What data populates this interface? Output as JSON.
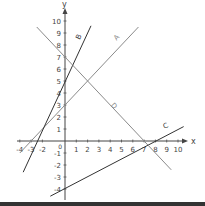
{
  "chart_data": {
    "type": "line",
    "title": "",
    "xlabel": "x",
    "ylabel": "y",
    "xlim": [
      -4,
      10
    ],
    "ylim": [
      -4,
      10
    ],
    "x_ticks": [
      "-4",
      "-3",
      "-2",
      "1",
      "2",
      "3",
      "4",
      "5",
      "6",
      "7",
      "8",
      "9",
      "10"
    ],
    "y_ticks": [
      "10",
      "9",
      "8",
      "7",
      "6",
      "5",
      "4",
      "3",
      "2",
      "1",
      "-1",
      "-2",
      "-3",
      "-4"
    ],
    "origin_label": "0",
    "grid": false,
    "legend": "inline labels",
    "series": [
      {
        "name": "A",
        "equation": "y = x + 3",
        "color": "#8a8a8a",
        "points": [
          [
            -4,
            -1
          ],
          [
            6.5,
            9.5
          ]
        ]
      },
      {
        "name": "B",
        "equation": "y = 2x + 5",
        "color": "#333333",
        "points": [
          [
            -3.7,
            -2.6
          ],
          [
            2.3,
            9.6
          ]
        ]
      },
      {
        "name": "C",
        "equation": "y = 0.5x - 4",
        "color": "#333333",
        "points": [
          [
            -1.3,
            -4.6
          ],
          [
            10.5,
            1.2
          ]
        ]
      },
      {
        "name": "D",
        "equation": "y = -x + 7",
        "color": "#8a8a8a",
        "points": [
          [
            -2.5,
            9.5
          ],
          [
            9.4,
            -2.4
          ]
        ]
      }
    ]
  }
}
